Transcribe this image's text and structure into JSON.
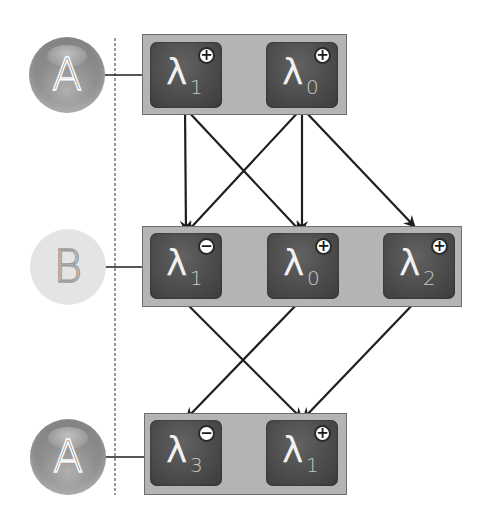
{
  "diagram": {
    "colors": {
      "group_fill": "#b4b4b4",
      "group_border": "#6e6e6e",
      "node_fill": "#4e4e4e",
      "edge": "#1e1e1e",
      "agent_dark": "#8e8e8e",
      "agent_light": "#e4e4e4"
    },
    "rows": [
      {
        "agent": {
          "label": "A",
          "style": "dark"
        },
        "nodes": [
          {
            "symbol": "λ",
            "index": "1",
            "sign": "+"
          },
          {
            "symbol": "λ",
            "index": "0",
            "sign": "+"
          }
        ]
      },
      {
        "agent": {
          "label": "B",
          "style": "light"
        },
        "nodes": [
          {
            "symbol": "λ",
            "index": "1",
            "sign": "−"
          },
          {
            "symbol": "λ",
            "index": "0",
            "sign": "+"
          },
          {
            "symbol": "λ",
            "index": "2",
            "sign": "+"
          }
        ]
      },
      {
        "agent": {
          "label": "A",
          "style": "dark"
        },
        "nodes": [
          {
            "symbol": "λ",
            "index": "3",
            "sign": "−"
          },
          {
            "symbol": "λ",
            "index": "1",
            "sign": "+"
          }
        ]
      }
    ],
    "edges": [
      {
        "from": "r0n0",
        "to": "r1n0"
      },
      {
        "from": "r0n0",
        "to": "r1n1"
      },
      {
        "from": "r0n1",
        "to": "r1n0"
      },
      {
        "from": "r0n1",
        "to": "r1n1"
      },
      {
        "from": "r0n1",
        "to": "r1n2"
      },
      {
        "from": "r1n0",
        "to": "r2n1"
      },
      {
        "from": "r1n1",
        "to": "r2n0"
      },
      {
        "from": "r1n2",
        "to": "r2n1"
      }
    ]
  }
}
